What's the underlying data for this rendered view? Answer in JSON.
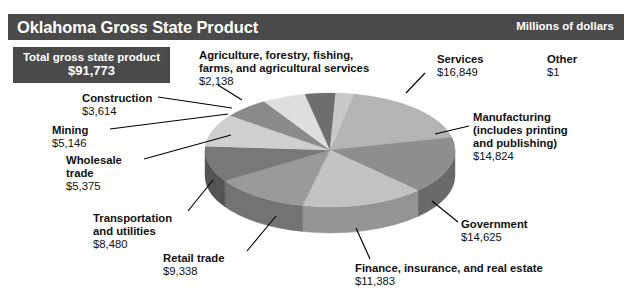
{
  "header": {
    "title": "Oklahoma Gross State Product",
    "units": "Millions of dollars",
    "bar_color": "#4a4a4a",
    "text_color": "#ffffff"
  },
  "total_box": {
    "label": "Total gross state product",
    "value": "$91,773",
    "background": "#4a4a4a",
    "text_color": "#ffffff"
  },
  "labels": {
    "agriculture": {
      "name": "Agriculture, forestry, fishing,",
      "name2": "farms, and agricultural services",
      "value": "$2,138"
    },
    "services": {
      "name": "Services",
      "value": "$16,849"
    },
    "other": {
      "name": "Other",
      "value": "$1"
    },
    "construction": {
      "name": "Construction",
      "value": "$3,614"
    },
    "mining": {
      "name": "Mining",
      "value": "$5,146"
    },
    "wholesale": {
      "name": "Wholesale",
      "name2": "trade",
      "value": "$5,375"
    },
    "transportation": {
      "name": "Transportation",
      "name2": "and utilities",
      "value": "$8,480"
    },
    "retail": {
      "name": "Retail trade",
      "value": "$9,338"
    },
    "manufacturing": {
      "name": "Manufacturing",
      "name2": "(includes printing",
      "name3": "and publishing)",
      "value": "$14,824"
    },
    "government": {
      "name": "Government",
      "value": "$14,625"
    },
    "finance": {
      "name": "Finance, insurance, and real estate",
      "value": "$11,383"
    }
  },
  "chart_data": {
    "type": "pie",
    "title": "Oklahoma Gross State Product",
    "subtitle": "Millions of dollars",
    "unit": "Millions of dollars",
    "total": 91773,
    "total_label": "Total gross state product",
    "three_d": true,
    "start_angle_deg": -79,
    "direction": "clockwise",
    "center": [
      330,
      150
    ],
    "radius_x": 125,
    "radius_y": 57,
    "depth": 26,
    "legend": "callout-labels",
    "categories": [
      "Services",
      "Manufacturing (includes printing and publishing)",
      "Government",
      "Finance, insurance, and real estate",
      "Retail trade",
      "Transportation and utilities",
      "Wholesale trade",
      "Mining",
      "Construction",
      "Agriculture, forestry, fishing, farms, and agricultural services",
      "Other"
    ],
    "values": [
      16849,
      14824,
      14625,
      11383,
      9338,
      8480,
      5375,
      5146,
      3614,
      2138,
      1
    ],
    "value_labels": [
      "$16,849",
      "$14,824",
      "$14,625",
      "$11,383",
      "$9,338",
      "$8,480",
      "$5,375",
      "$5,146",
      "$3,614",
      "$2,138",
      "$1"
    ],
    "percentages": [
      18.36,
      16.15,
      15.94,
      12.4,
      10.17,
      9.24,
      5.86,
      5.61,
      3.94,
      2.33,
      0.0
    ],
    "slice_colors": [
      "#b4b4b4",
      "#8e8e8e",
      "#c2c2c2",
      "#9a9a9a",
      "#787878",
      "#cfcfcf",
      "#8a8a8a",
      "#dedede",
      "#6e6e6e",
      "#c8c8c8",
      "#3a3a3a"
    ],
    "side_colors": [
      "#8a8a8a",
      "#6a6a6a",
      "#949494",
      "#737373",
      "#545454",
      "#a0a0a0",
      "#666666",
      "#ababab",
      "#4d4d4d",
      "#9b9b9b",
      "#2a2a2a"
    ]
  }
}
